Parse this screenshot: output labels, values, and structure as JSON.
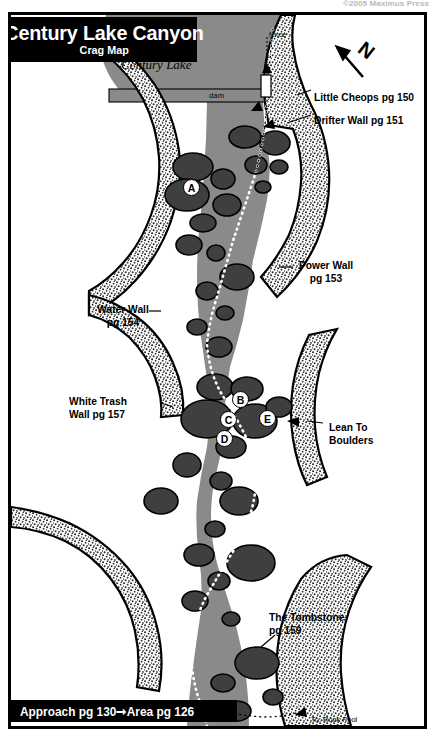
{
  "copyright": "©2005 Maximus Press",
  "title": {
    "main": "Century Lake Canyon",
    "sub": "Crag Map"
  },
  "footer": {
    "text": "Approach pg 130➞Area pg 126"
  },
  "compass": {
    "label": "N",
    "icon": "north-arrow-icon"
  },
  "features": {
    "lake_name": "Century Lake",
    "dam_label": "dam",
    "fence_label": "fence",
    "rock_pool_line1": "To: Rock Pool",
    "rock_pool_line2": "(20-25 min.)"
  },
  "crag_labels": [
    {
      "id": "little-cheops",
      "line1": "Little Cheops pg 150",
      "line2": ""
    },
    {
      "id": "drifter-wall",
      "line1": "Drifter Wall pg 151",
      "line2": ""
    },
    {
      "id": "power-wall",
      "line1": "Power Wall",
      "line2": "pg 153"
    },
    {
      "id": "water-wall",
      "line1": "Water Wall",
      "line2": "pg 154"
    },
    {
      "id": "white-trash-wall",
      "line1": "White Trash",
      "line2": "Wall pg 157"
    },
    {
      "id": "lean-to-boulders",
      "line1": "Lean To",
      "line2": "Boulders"
    },
    {
      "id": "the-tombstone",
      "line1": "The Tombstone",
      "line2": "pg 159"
    }
  ],
  "climb_markers": [
    {
      "letter": "A"
    },
    {
      "letter": "B"
    },
    {
      "letter": "C"
    },
    {
      "letter": "D"
    },
    {
      "letter": "E"
    }
  ],
  "colors": {
    "ink": "#000000",
    "paper": "#ffffff",
    "river": "#8a8a8a",
    "boulder": "#3f3f3f",
    "lake": "#8a8a8a",
    "cliff_stipple": "#2b2b2b"
  }
}
